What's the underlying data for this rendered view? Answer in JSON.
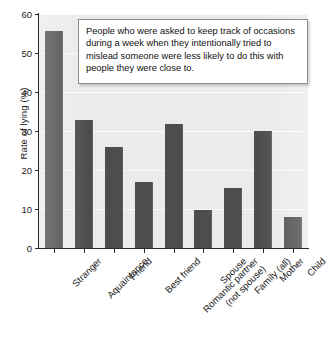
{
  "chart_data": {
    "type": "bar",
    "title": "",
    "xlabel": "",
    "ylabel": "Rate of lying (%)",
    "ylim": [
      0,
      60
    ],
    "yticks": [
      0,
      10,
      20,
      30,
      40,
      50,
      60
    ],
    "grid": true,
    "legend": "none",
    "categories": [
      "Stranger",
      "Aquaintance",
      "Friend",
      "Best friend",
      "Romantic partner\n(not spouse)",
      "Spouse",
      "Family (all)",
      "Mother",
      "Child"
    ],
    "values": [
      55.6,
      32.8,
      26.0,
      17.0,
      31.7,
      9.8,
      15.3,
      30.0,
      8.0
    ],
    "annotations": [
      "People who were asked to keep track of occasions during a week when they intentionally tried to mislead someone were less likely to do this with people they were close to."
    ]
  },
  "colors": {
    "bar": "#4d4d4d",
    "plot_background": "#ebebeb",
    "gridline": "#fafafa",
    "axis": "#2b2b2b",
    "callout_border": "#8c8c8c",
    "callout_background": "#ffffff",
    "text": "#1b1b1b"
  },
  "axis": {
    "y_title": "Rate of lying (%)",
    "y_tick_labels": [
      "60",
      "50",
      "40",
      "30",
      "20",
      "10",
      "0"
    ]
  },
  "callout": {
    "text": "People who were asked to keep track of occasions during a week when they intentionally tried to mislead someone were less likely to do this with people they were close to."
  },
  "caption": {
    "text": ""
  }
}
